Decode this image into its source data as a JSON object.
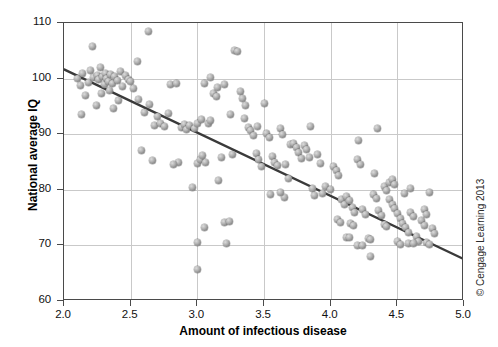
{
  "chart_data": {
    "type": "scatter",
    "title": "",
    "xlabel": "Amount of infectious disease",
    "ylabel": "National average IQ",
    "xlim": [
      2.0,
      5.0
    ],
    "ylim": [
      60,
      110
    ],
    "xticks": [
      "2.0",
      "2.5",
      "3.0",
      "3.5",
      "4.0",
      "4.5",
      "5.0"
    ],
    "yticks": [
      "60",
      "70",
      "80",
      "90",
      "100",
      "110"
    ],
    "xtick_values": [
      2.0,
      2.5,
      3.0,
      3.5,
      4.0,
      4.5,
      5.0
    ],
    "ytick_values": [
      60,
      70,
      80,
      90,
      100,
      110
    ],
    "grid": true,
    "legend": "none",
    "marker_color": "#8e8e8e",
    "trendline": {
      "label": "linear fit",
      "color": "#3a3a3a",
      "x_start": 2.0,
      "y_start": 101.6,
      "x_end": 5.0,
      "y_end": 67.4
    },
    "points": [
      [
        2.63,
        108.5
      ],
      [
        2.1,
        100.0
      ],
      [
        2.14,
        101.0
      ],
      [
        2.18,
        99.3
      ],
      [
        2.2,
        101.5
      ],
      [
        2.22,
        100.2
      ],
      [
        2.25,
        100.6
      ],
      [
        2.26,
        99.8
      ],
      [
        2.27,
        102.0
      ],
      [
        2.29,
        100.4
      ],
      [
        2.3,
        99.0
      ],
      [
        2.31,
        100.9
      ],
      [
        2.32,
        100.1
      ],
      [
        2.33,
        99.5
      ],
      [
        2.35,
        100.7
      ],
      [
        2.36,
        99.2
      ],
      [
        2.38,
        100.3
      ],
      [
        2.4,
        99.6
      ],
      [
        2.42,
        101.2
      ],
      [
        2.44,
        98.6
      ],
      [
        2.12,
        98.8
      ],
      [
        2.16,
        97.0
      ],
      [
        2.28,
        97.4
      ],
      [
        2.34,
        97.8
      ],
      [
        2.46,
        100.5
      ],
      [
        2.48,
        99.9
      ],
      [
        2.13,
        93.5
      ],
      [
        2.24,
        95.2
      ],
      [
        2.37,
        94.6
      ],
      [
        2.41,
        96.0
      ],
      [
        2.21,
        105.8
      ],
      [
        2.55,
        103.0
      ],
      [
        2.5,
        99.4
      ],
      [
        2.52,
        98.2
      ],
      [
        2.56,
        96.3
      ],
      [
        2.6,
        94.0
      ],
      [
        2.64,
        95.4
      ],
      [
        2.68,
        91.6
      ],
      [
        2.7,
        93.2
      ],
      [
        2.72,
        92.0
      ],
      [
        2.75,
        91.4
      ],
      [
        2.78,
        93.8
      ],
      [
        2.8,
        98.9
      ],
      [
        2.84,
        99.1
      ],
      [
        2.88,
        91.2
      ],
      [
        2.9,
        91.8
      ],
      [
        2.92,
        90.8
      ],
      [
        2.94,
        91.5
      ],
      [
        2.96,
        80.4
      ],
      [
        2.58,
        87.0
      ],
      [
        2.66,
        85.2
      ],
      [
        2.98,
        91.0
      ],
      [
        3.0,
        92.0
      ],
      [
        3.0,
        84.8
      ],
      [
        3.0,
        70.5
      ],
      [
        3.0,
        65.7
      ],
      [
        3.02,
        85.5
      ],
      [
        3.04,
        86.2
      ],
      [
        3.06,
        85.0
      ],
      [
        3.05,
        73.2
      ],
      [
        3.08,
        91.9
      ],
      [
        3.1,
        92.4
      ],
      [
        3.12,
        97.4
      ],
      [
        3.14,
        96.8
      ],
      [
        3.16,
        81.6
      ],
      [
        3.18,
        85.8
      ],
      [
        3.2,
        74.2
      ],
      [
        3.24,
        74.3
      ],
      [
        3.22,
        70.4
      ],
      [
        3.26,
        86.4
      ],
      [
        3.28,
        105.0
      ],
      [
        3.3,
        104.8
      ],
      [
        3.32,
        97.6
      ],
      [
        3.34,
        96.4
      ],
      [
        3.36,
        95.2
      ],
      [
        3.38,
        91.2
      ],
      [
        3.4,
        90.6
      ],
      [
        3.42,
        89.8
      ],
      [
        3.44,
        86.6
      ],
      [
        3.46,
        85.4
      ],
      [
        3.48,
        84.2
      ],
      [
        3.05,
        99.2
      ],
      [
        3.15,
        98.4
      ],
      [
        3.25,
        93.6
      ],
      [
        3.35,
        92.8
      ],
      [
        3.45,
        91.4
      ],
      [
        3.5,
        95.6
      ],
      [
        3.52,
        90.2
      ],
      [
        3.54,
        89.4
      ],
      [
        3.56,
        86.0
      ],
      [
        3.58,
        85.0
      ],
      [
        3.6,
        84.4
      ],
      [
        3.62,
        91.0
      ],
      [
        3.64,
        90.0
      ],
      [
        3.66,
        84.6
      ],
      [
        3.68,
        82.0
      ],
      [
        3.7,
        88.2
      ],
      [
        3.72,
        88.4
      ],
      [
        3.74,
        87.6
      ],
      [
        3.76,
        86.8
      ],
      [
        3.78,
        85.6
      ],
      [
        3.8,
        88.0
      ],
      [
        3.82,
        87.2
      ],
      [
        3.84,
        85.8
      ],
      [
        3.86,
        80.2
      ],
      [
        3.88,
        79.0
      ],
      [
        3.9,
        86.4
      ],
      [
        3.92,
        84.8
      ],
      [
        3.94,
        79.4
      ],
      [
        3.96,
        80.6
      ],
      [
        3.55,
        79.2
      ],
      [
        3.65,
        78.6
      ],
      [
        3.1,
        100.2
      ],
      [
        3.2,
        99.0
      ],
      [
        3.85,
        91.4
      ],
      [
        4.0,
        80.0
      ],
      [
        4.02,
        84.2
      ],
      [
        4.04,
        83.4
      ],
      [
        4.06,
        82.6
      ],
      [
        4.08,
        78.2
      ],
      [
        4.1,
        77.4
      ],
      [
        4.12,
        78.8
      ],
      [
        4.14,
        78.0
      ],
      [
        4.16,
        76.8
      ],
      [
        4.18,
        76.0
      ],
      [
        4.2,
        85.4
      ],
      [
        4.22,
        84.6
      ],
      [
        4.24,
        76.4
      ],
      [
        4.26,
        75.6
      ],
      [
        4.28,
        71.2
      ],
      [
        4.3,
        71.0
      ],
      [
        4.32,
        79.2
      ],
      [
        4.34,
        78.4
      ],
      [
        4.36,
        76.2
      ],
      [
        4.38,
        75.4
      ],
      [
        4.4,
        80.6
      ],
      [
        4.42,
        79.8
      ],
      [
        4.44,
        78.2
      ],
      [
        4.46,
        77.4
      ],
      [
        4.48,
        76.6
      ],
      [
        4.5,
        75.8
      ],
      [
        4.44,
        81.4
      ],
      [
        4.46,
        81.8
      ],
      [
        4.48,
        81.0
      ],
      [
        4.52,
        74.8
      ],
      [
        4.54,
        74.0
      ],
      [
        4.56,
        73.2
      ],
      [
        4.58,
        72.4
      ],
      [
        4.6,
        76.0
      ],
      [
        4.62,
        75.2
      ],
      [
        4.64,
        71.6
      ],
      [
        4.66,
        70.8
      ],
      [
        4.68,
        74.4
      ],
      [
        4.7,
        73.6
      ],
      [
        4.72,
        70.6
      ],
      [
        4.74,
        70.2
      ],
      [
        4.76,
        73.0
      ],
      [
        4.78,
        72.2
      ],
      [
        4.2,
        70.0
      ],
      [
        4.24,
        70.0
      ],
      [
        4.12,
        71.4
      ],
      [
        4.14,
        71.4
      ],
      [
        4.3,
        68.0
      ],
      [
        4.35,
        91.0
      ],
      [
        4.55,
        79.4
      ],
      [
        4.58,
        70.4
      ],
      [
        4.62,
        70.4
      ],
      [
        4.4,
        73.8
      ],
      [
        4.42,
        73.4
      ],
      [
        4.5,
        70.8
      ],
      [
        4.52,
        70.2
      ],
      [
        4.05,
        74.6
      ],
      [
        4.07,
        74.2
      ],
      [
        4.15,
        74.0
      ],
      [
        4.17,
        73.6
      ],
      [
        4.6,
        80.2
      ],
      [
        4.74,
        79.6
      ],
      [
        4.7,
        76.4
      ],
      [
        4.72,
        75.6
      ],
      [
        3.62,
        79.6
      ],
      [
        4.21,
        88.8
      ],
      [
        4.33,
        83.0
      ],
      [
        2.86,
        85.0
      ],
      [
        2.82,
        84.6
      ],
      [
        3.03,
        92.6
      ]
    ]
  }
}
